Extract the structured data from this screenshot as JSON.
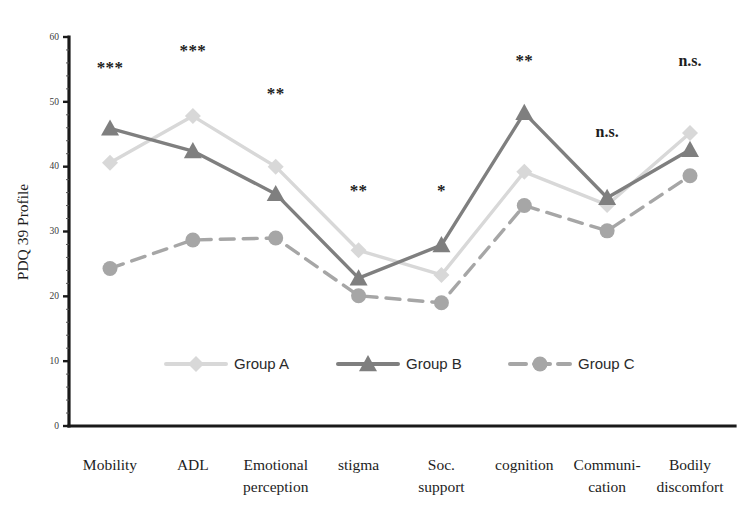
{
  "chart_data": {
    "type": "line",
    "title": "",
    "xlabel": "",
    "ylabel": "PDQ 39 Profile",
    "ylim": [
      0,
      60
    ],
    "yticks": [
      0,
      10,
      20,
      30,
      40,
      50,
      60
    ],
    "grid": false,
    "legend_position": "bottom-center",
    "categories": [
      "Mobility",
      "ADL",
      "Emotional perception",
      "stigma",
      "Soc. support",
      "cognition",
      "Communi- cation",
      "Bodily discomfort"
    ],
    "category_lines": [
      [
        "Mobility",
        ""
      ],
      [
        "ADL",
        ""
      ],
      [
        "Emotional",
        "perception"
      ],
      [
        "stigma",
        ""
      ],
      [
        "Soc.",
        "support"
      ],
      [
        "cognition",
        ""
      ],
      [
        "Communi-",
        "cation"
      ],
      [
        "Bodily",
        "discomfort"
      ]
    ],
    "series": [
      {
        "name": "Group A",
        "color": "#d8d8d8",
        "marker": "diamond",
        "dash": "none",
        "values": [
          40.6,
          47.8,
          40.0,
          27.1,
          23.3,
          39.2,
          34.1,
          45.2
        ]
      },
      {
        "name": "Group B",
        "color": "#7f7f7f",
        "marker": "triangle",
        "dash": "none",
        "values": [
          45.9,
          42.4,
          35.8,
          22.8,
          27.9,
          48.3,
          35.2,
          42.6
        ]
      },
      {
        "name": "Group C",
        "color": "#a6a6a6",
        "marker": "circle",
        "dash": "dashed",
        "values": [
          24.3,
          28.7,
          29.0,
          20.1,
          19.0,
          34.0,
          30.1,
          38.6
        ]
      }
    ],
    "annotations": [
      {
        "category": "Mobility",
        "text": "***",
        "kind": "stars"
      },
      {
        "category": "ADL",
        "text": "***",
        "kind": "stars"
      },
      {
        "category": "Emotional perception",
        "text": "**",
        "kind": "stars"
      },
      {
        "category": "stigma",
        "text": "**",
        "kind": "stars"
      },
      {
        "category": "Soc. support",
        "text": "*",
        "kind": "stars"
      },
      {
        "category": "cognition",
        "text": "**",
        "kind": "stars"
      },
      {
        "category": "Communi- cation",
        "text": "n.s.",
        "kind": "ns"
      },
      {
        "category": "Bodily discomfort",
        "text": "n.s.",
        "kind": "ns"
      }
    ],
    "annotation_y": [
      54.5,
      57.0,
      50.5,
      35.5,
      35.5,
      55.5,
      44.5,
      55.5
    ]
  },
  "legend": {
    "items": [
      {
        "label": "Group A"
      },
      {
        "label": "Group B"
      },
      {
        "label": "Group C"
      }
    ]
  }
}
